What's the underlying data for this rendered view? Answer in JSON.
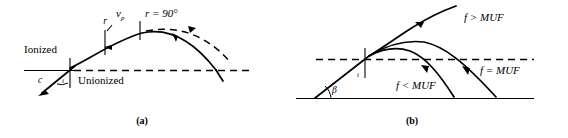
{
  "figure": {
    "panels": [
      {
        "id": "a",
        "caption": "(a)",
        "labels": {
          "ionized": "Ionized",
          "unionized": "Unionized",
          "ray_r": "r",
          "velocity": "v",
          "velocity_sub": "p",
          "r_ninety": "r = 90°",
          "c_label": "c",
          "angle_i": "i"
        }
      },
      {
        "id": "b",
        "caption": "(b)",
        "labels": {
          "f_greater": "f > MUF",
          "f_equal": "f = MUF",
          "f_less": "f < MUF",
          "beta": "β",
          "angle_i": "i"
        }
      }
    ]
  },
  "colors": {
    "ink": "#000000",
    "background": "#ffffff"
  }
}
